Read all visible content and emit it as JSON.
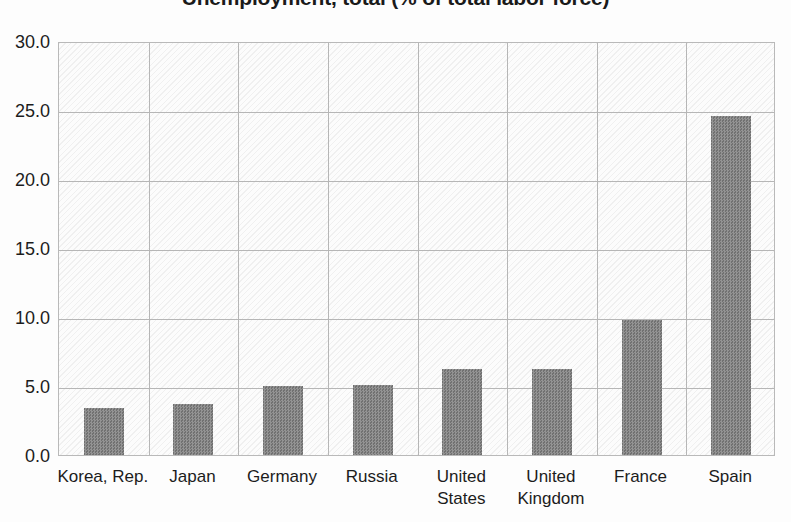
{
  "chart_data": {
    "type": "bar",
    "title": "Unemployment, total (% of total labor force)",
    "xlabel": "",
    "ylabel": "",
    "categories": [
      "Korea, Rep.",
      "Japan",
      "Germany",
      "Russia",
      "United\nStates",
      "United\nKingdom",
      "France",
      "Spain"
    ],
    "values": [
      3.4,
      3.7,
      5.0,
      5.1,
      6.2,
      6.2,
      9.8,
      24.6
    ],
    "ylim": [
      0.0,
      30.0
    ],
    "ytick_values": [
      0.0,
      5.0,
      10.0,
      15.0,
      20.0,
      25.0,
      30.0
    ],
    "ytick_labels": [
      "0.0",
      "5.0",
      "10.0",
      "15.0",
      "20.0",
      "25.0",
      "30.0"
    ],
    "grid": true,
    "legend": false,
    "bar_color": "#7e7e7e",
    "grid_color": "#b6b6b6",
    "plot_background": "#fcfcfc"
  }
}
